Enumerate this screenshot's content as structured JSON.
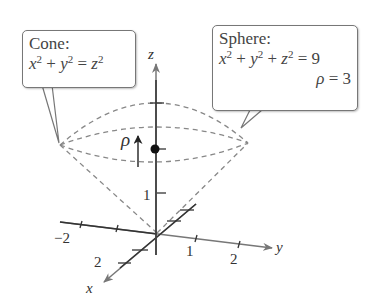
{
  "cone_callout": {
    "title": "Cone:",
    "equation": "x^2 + y^2 = z^2",
    "eq_parts": {
      "x": "x",
      "y": "y",
      "z": "z",
      "exp": "2",
      "plus": " + ",
      "eq": " = "
    }
  },
  "sphere_callout": {
    "title": "Sphere:",
    "equation": "x^2 + y^2 + z^2 = 9",
    "eq_parts": {
      "x": "x",
      "y": "y",
      "z": "z",
      "exp": "2",
      "plus": " + ",
      "eq": " = ",
      "rhs": "9"
    },
    "rho_line": {
      "rho": "ρ",
      "eq": " = ",
      "value": "3"
    }
  },
  "axes": {
    "x_label": "x",
    "y_label": "y",
    "z_label": "z",
    "x_ticks": [
      "2"
    ],
    "y_ticks": [
      "−2",
      "1",
      "2"
    ],
    "z_ticks": [
      "1"
    ]
  },
  "annotations": {
    "rho_label": "ρ"
  },
  "colors": {
    "axis": "#333333",
    "dashed": "#888888",
    "callout_border": "#777777"
  }
}
